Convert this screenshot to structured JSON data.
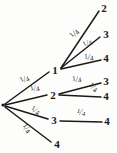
{
  "diagram": {
    "type": "probability-tree",
    "background_color": "#fdfdfc",
    "stroke_color": "#1a1a1a",
    "root": {
      "label": "",
      "x": 3,
      "y": 105
    },
    "nodes": [
      {
        "id": "n1",
        "label": "1",
        "x": 55,
        "y": 70,
        "level": 1
      },
      {
        "id": "n2",
        "label": "2",
        "x": 53,
        "y": 95,
        "level": 1
      },
      {
        "id": "n3",
        "label": "3",
        "x": 54,
        "y": 120,
        "level": 1
      },
      {
        "id": "n4",
        "label": "4",
        "x": 57,
        "y": 144,
        "level": 1
      },
      {
        "id": "l1",
        "label": "2",
        "x": 104,
        "y": 8,
        "level": 2
      },
      {
        "id": "l2",
        "label": "3",
        "x": 106,
        "y": 34,
        "level": 2
      },
      {
        "id": "l3",
        "label": "4",
        "x": 106,
        "y": 58,
        "level": 2
      },
      {
        "id": "l4",
        "label": "3",
        "x": 106,
        "y": 81,
        "level": 2
      },
      {
        "id": "l5",
        "label": "4",
        "x": 106,
        "y": 96,
        "level": 2
      },
      {
        "id": "l6",
        "label": "4",
        "x": 107,
        "y": 121,
        "level": 2
      }
    ],
    "edges": [
      {
        "id": "e-root-1",
        "from": "root",
        "to": "n1",
        "x1": 5,
        "y1": 104,
        "x2": 49,
        "y2": 72,
        "probability": "1/4",
        "numerator": "1",
        "denominator": "4",
        "label_x": 25,
        "label_y": 80,
        "label_rotate": -36
      },
      {
        "id": "e-root-2",
        "from": "root",
        "to": "n2",
        "x1": 5,
        "y1": 105,
        "x2": 47,
        "y2": 95,
        "probability": "1/4",
        "numerator": "1",
        "denominator": "4",
        "label_x": 35,
        "label_y": 89,
        "label_rotate": -22
      },
      {
        "id": "e-root-3",
        "from": "root",
        "to": "n3",
        "x1": 5,
        "y1": 106,
        "x2": 48,
        "y2": 119,
        "probability": "1/4",
        "numerator": "1",
        "denominator": "4",
        "label_x": 35,
        "label_y": 111,
        "label_rotate": 20
      },
      {
        "id": "e-root-4",
        "from": "root",
        "to": "n4",
        "x1": 5,
        "y1": 107,
        "x2": 51,
        "y2": 142,
        "probability": "1/4",
        "numerator": "1",
        "denominator": "4",
        "label_x": 26,
        "label_y": 129,
        "label_rotate": 38
      },
      {
        "id": "e-1-2",
        "from": "n1",
        "to": "l1",
        "x1": 61,
        "y1": 68,
        "x2": 99,
        "y2": 11,
        "probability": "1/4",
        "numerator": "1",
        "denominator": "4",
        "label_x": 75,
        "label_y": 34,
        "label_rotate": -57
      },
      {
        "id": "e-1-3",
        "from": "n1",
        "to": "l2",
        "x1": 61,
        "y1": 68,
        "x2": 100,
        "y2": 37,
        "probability": "1/4",
        "numerator": "1",
        "denominator": "4",
        "label_x": 88,
        "label_y": 44,
        "label_rotate": -39
      },
      {
        "id": "e-1-4",
        "from": "n1",
        "to": "l3",
        "x1": 61,
        "y1": 69,
        "x2": 101,
        "y2": 60,
        "probability": "1/4",
        "numerator": "1",
        "denominator": "4",
        "label_x": 89,
        "label_y": 58,
        "label_rotate": -13
      },
      {
        "id": "e-2-3",
        "from": "n2",
        "to": "l4",
        "x1": 59,
        "y1": 94,
        "x2": 101,
        "y2": 83,
        "probability": "1/4",
        "numerator": "1",
        "denominator": "4",
        "label_x": 77,
        "label_y": 80,
        "label_rotate": -15
      },
      {
        "id": "e-2-4",
        "from": "n2",
        "to": "l5",
        "x1": 59,
        "y1": 95,
        "x2": 101,
        "y2": 97,
        "probability": "1/4",
        "numerator": "1",
        "denominator": "4",
        "label_x": 93,
        "label_y": 88,
        "label_rotate": 25
      },
      {
        "id": "e-3-4",
        "from": "n3",
        "to": "l6",
        "x1": 60,
        "y1": 121,
        "x2": 102,
        "y2": 122,
        "probability": "1/4",
        "numerator": "1",
        "denominator": "4",
        "label_x": 81,
        "label_y": 113,
        "label_rotate": 0
      }
    ]
  }
}
